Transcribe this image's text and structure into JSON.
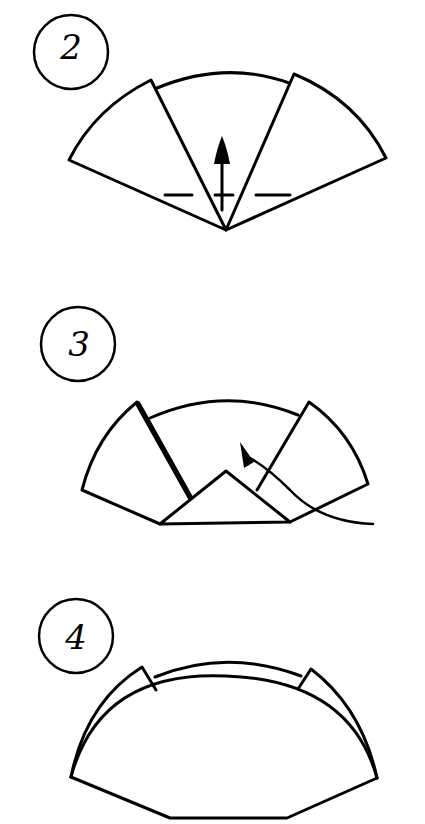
{
  "diagram": {
    "type": "origami-instructions",
    "colors": {
      "ink": "#000000",
      "paper": "#ffffff"
    },
    "steps": [
      {
        "number": "2",
        "description": "Fan shape with left and right flaps folded; dashed valley fold line across lower part; arrow pointing up indicating fold upward"
      },
      {
        "number": "3",
        "description": "Bottom point folded up into triangle; curved arrow indicates tucking the right side under"
      },
      {
        "number": "4",
        "description": "Result: rounded shape with two small flaps at top corners and an inner arc"
      }
    ]
  }
}
